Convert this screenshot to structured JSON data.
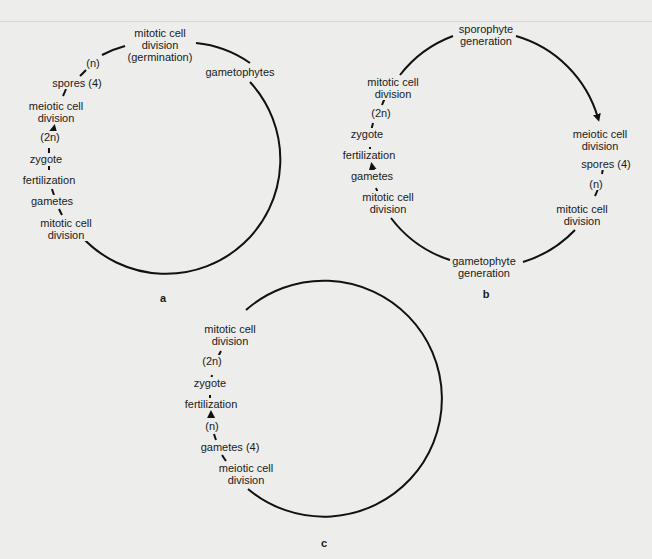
{
  "diagram": {
    "panels": [
      {
        "id": "a",
        "letter": "a",
        "labels": {
          "top": "mitotic cell\ndivision\n(germination)",
          "gametophytes": "gametophytes",
          "n": "(n)",
          "spores": "spores (4)",
          "meiotic": "meiotic cell\ndivision",
          "two_n": "(2n)",
          "zygote": "zygote",
          "fertilization": "fertilization",
          "gametes": "gametes",
          "mitotic_bottom": "mitotic cell\ndivision"
        }
      },
      {
        "id": "b",
        "letter": "b",
        "labels": {
          "sporophyte": "sporophyte\ngeneration",
          "mitotic_left_top": "mitotic cell\ndivision",
          "two_n": "(2n)",
          "zygote": "zygote",
          "fertilization": "fertilization",
          "gametes": "gametes",
          "mitotic_left_bottom": "mitotic cell\ndivision",
          "meiotic": "meiotic cell\ndivision",
          "spores": "spores (4)",
          "n": "(n)",
          "mitotic_right": "mitotic cell\ndivision",
          "gametophyte": "gametophyte\ngeneration"
        }
      },
      {
        "id": "c",
        "letter": "c",
        "labels": {
          "mitotic": "mitotic cell\ndivision",
          "two_n": "(2n)",
          "zygote": "zygote",
          "fertilization": "fertilization",
          "n": "(n)",
          "gametes": "gametes (4)",
          "meiotic": "meiotic cell\ndivision"
        }
      }
    ],
    "colors": {
      "line": "#111111",
      "background": "#ededeb"
    }
  }
}
